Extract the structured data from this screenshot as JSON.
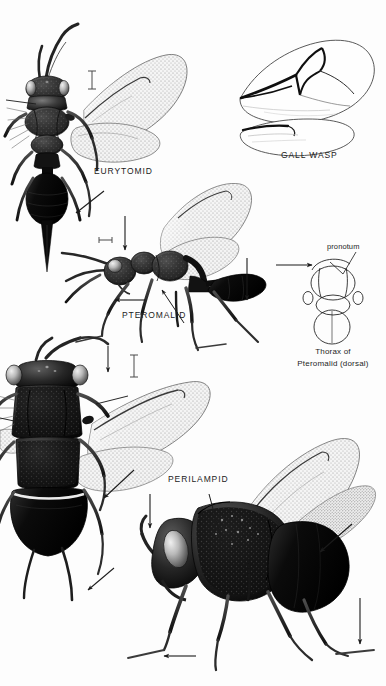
{
  "plate": {
    "title": "Chalcidoid Wasp Identification Plate",
    "background_color": "#fdfdfd",
    "ink_color": "#1b1b1b",
    "width": 386,
    "height": 686
  },
  "figures": [
    {
      "key": "eurytomid",
      "label": "EURYTOMID",
      "view": "dorsal",
      "label_x": 94,
      "label_y": 166
    },
    {
      "key": "gall_wasp",
      "label": "GALL WASP",
      "view": "fore and hind wing",
      "label_x": 281,
      "label_y": 150
    },
    {
      "key": "pteromalid",
      "label": "PTEROMALID",
      "view": "lateral",
      "label_x": 122,
      "label_y": 310
    },
    {
      "key": "perilampid",
      "label": "PERILAMPID",
      "view": "dorsal and lateral",
      "label_x": 168,
      "label_y": 474
    }
  ],
  "captions": {
    "thorax_line1": "Thorax of",
    "thorax_line2": "Pteromalid (dorsal)",
    "thorax_x": 283,
    "thorax_y": 346
  },
  "callouts": [
    {
      "text": "pronotum",
      "x": 327,
      "y": 242
    }
  ],
  "scale_bars": [
    {
      "key": "eurytomid-scale",
      "orientation": "vertical",
      "x": 92,
      "y": 71,
      "length": 18
    },
    {
      "key": "pteromalid-scale",
      "orientation": "horizontal",
      "x": 99,
      "y": 240,
      "length": 13
    },
    {
      "key": "perilampid-scale",
      "orientation": "vertical",
      "x": 134,
      "y": 355,
      "length": 22
    }
  ],
  "colors": {
    "ink": "#1b1b1b",
    "body_dark": "#161616",
    "body_mid": "#3a3a3a",
    "body_light": "#6e6e6e",
    "wing_stipple": "#8f8f8f",
    "wing_membrane": "#f2f2f2",
    "vein": "#111111",
    "paper": "#fdfdfd",
    "highlight": "#dcdcdc"
  }
}
